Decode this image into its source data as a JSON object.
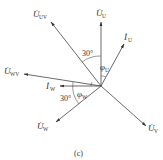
{
  "diagram": {
    "caption": "(c)",
    "origin": [
      101,
      86
    ],
    "colors": {
      "line": "#444444",
      "text": "#333333",
      "background": "#ffffff"
    },
    "vectors": [
      {
        "id": "U_U",
        "symbol": "U",
        "subscript": "U",
        "dot": true,
        "tip": [
          101,
          22
        ]
      },
      {
        "id": "I_U",
        "symbol": "I",
        "subscript": "U",
        "dot": true,
        "tip": [
          124,
          44
        ]
      },
      {
        "id": "U_UV",
        "symbol": "U",
        "subscript": "UV",
        "dot": true,
        "tip": [
          50,
          21
        ]
      },
      {
        "id": "U_WV",
        "symbol": "U",
        "subscript": "WV",
        "dot": true,
        "tip": [
          23,
          73
        ]
      },
      {
        "id": "I_W",
        "symbol": "I",
        "subscript": "W",
        "dot": true,
        "tip": [
          60,
          86
        ]
      },
      {
        "id": "U_W",
        "symbol": "U",
        "subscript": "W",
        "dot": true,
        "tip": [
          55,
          122
        ]
      },
      {
        "id": "U_V",
        "symbol": "U",
        "subscript": "V",
        "dot": true,
        "tip": [
          146,
          126
        ]
      }
    ],
    "angles": [
      {
        "id": "angle_UV_U",
        "label": "30°"
      },
      {
        "id": "phi_U",
        "symbol": "φ",
        "subscript": "U"
      },
      {
        "id": "angle_WV_W",
        "label": "30°"
      },
      {
        "id": "phi_W",
        "symbol": "φ",
        "subscript": "W"
      }
    ]
  }
}
